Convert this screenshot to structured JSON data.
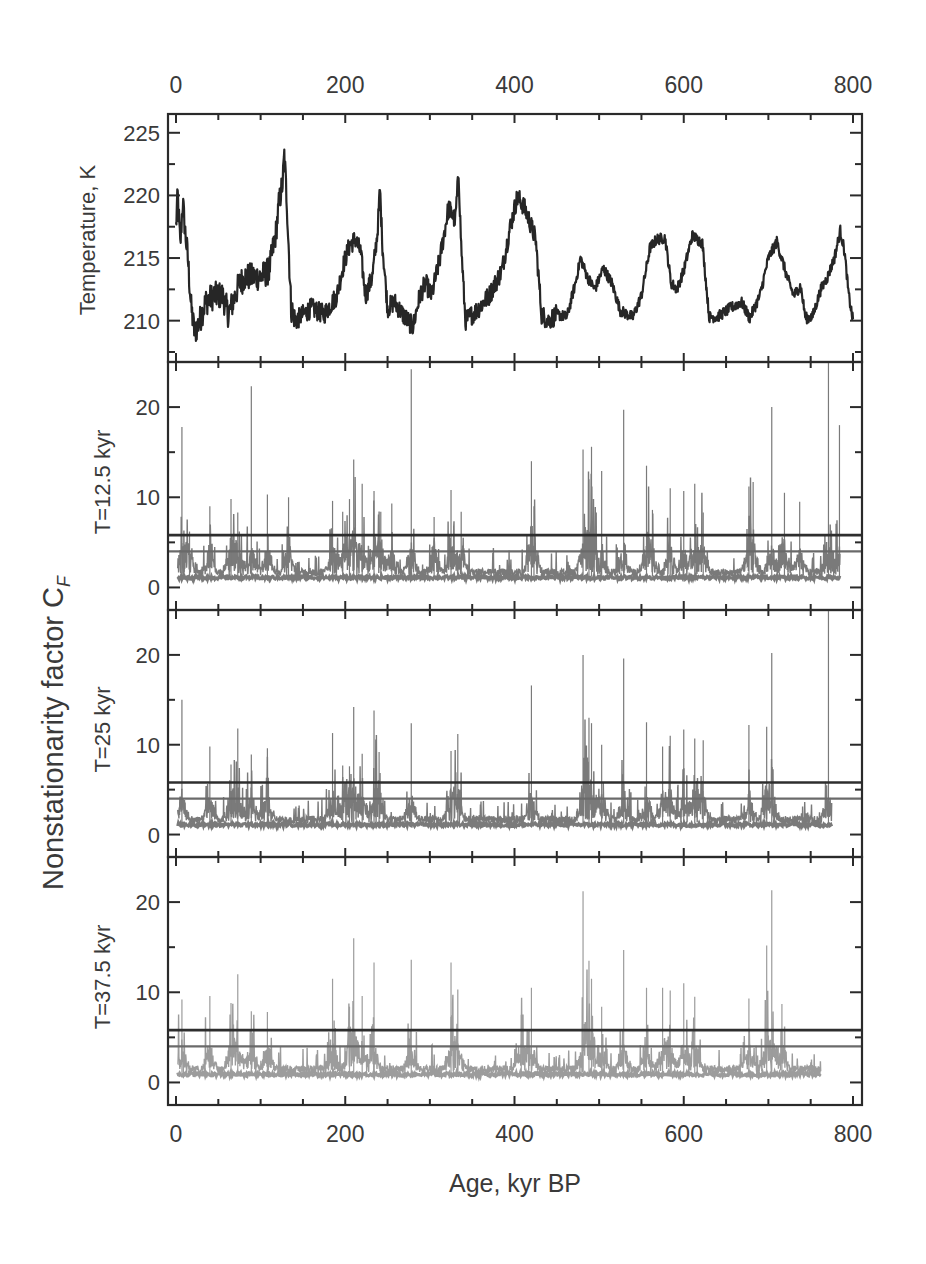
{
  "chart_data": {
    "type": "line",
    "layout": "4 vertically stacked panels sharing x axis",
    "x_axis": {
      "label": "Age, kyr BP",
      "range": [
        0,
        800
      ],
      "major_ticks": [
        0,
        200,
        400,
        600,
        800
      ],
      "minor_tick_step": 50,
      "top_tick_labels": [
        "0",
        "200",
        "400",
        "600",
        "800"
      ],
      "bottom_tick_labels": [
        "0",
        "200",
        "400",
        "600",
        "800"
      ]
    },
    "shared_ylabel": {
      "text": "Nonstationarity factor C",
      "subscript": "F"
    },
    "panels": [
      {
        "id": "temperature",
        "ylabel": "Temperature, K",
        "ylim": [
          206.7,
          226.5
        ],
        "major_ticks": [
          210,
          215,
          220,
          225
        ],
        "tick_labels": [
          "210",
          "215",
          "220",
          "225"
        ],
        "minor_tick_step": 2.5,
        "series_color": "#262626",
        "series": {
          "name": "Temperature",
          "x": [
            0,
            2,
            5,
            8,
            11,
            14,
            18,
            22,
            28,
            35,
            45,
            55,
            62,
            70,
            75,
            82,
            90,
            100,
            110,
            118,
            122,
            126,
            128,
            131,
            136,
            142,
            150,
            160,
            175,
            190,
            198,
            205,
            212,
            218,
            224,
            232,
            238,
            241,
            244,
            250,
            258,
            268,
            280,
            288,
            295,
            302,
            312,
            322,
            330,
            334,
            337,
            342,
            355,
            370,
            385,
            395,
            403,
            408,
            415,
            425,
            432,
            440,
            450,
            462,
            472,
            478,
            486,
            495,
            505,
            515,
            525,
            533,
            540,
            550,
            560,
            568,
            578,
            585,
            592,
            600,
            610,
            622,
            630,
            640,
            655,
            668,
            678,
            690,
            700,
            710,
            722,
            730,
            738,
            744,
            752,
            762,
            770,
            778,
            785,
            790,
            795,
            800
          ],
          "y": [
            217.5,
            220,
            216,
            219.5,
            217,
            215,
            211,
            209,
            210,
            211.5,
            212,
            212,
            210.5,
            212,
            213,
            213.5,
            213.5,
            213.5,
            214,
            217,
            219.5,
            221,
            223.2,
            219.5,
            211,
            210,
            210.5,
            211,
            210.5,
            212,
            214.5,
            216,
            216.5,
            215.5,
            212,
            213.5,
            217,
            220.5,
            216,
            211,
            211.5,
            210.5,
            209.5,
            212,
            213,
            212,
            215,
            219,
            218,
            221.8,
            216,
            210,
            210.8,
            212,
            214,
            217.5,
            219.8,
            219.5,
            218.5,
            216.5,
            210.5,
            210,
            210.5,
            210.3,
            213,
            215,
            213.5,
            212.5,
            214.2,
            213,
            210.8,
            210.5,
            210.3,
            212,
            215.8,
            216.5,
            216.6,
            213,
            212.5,
            214,
            216.8,
            216.2,
            210.3,
            210.3,
            211,
            211.5,
            210.2,
            212,
            215,
            216.3,
            213.5,
            212,
            212.8,
            210.2,
            210.3,
            212.5,
            213.5,
            215,
            217.2,
            215.5,
            212,
            210
          ]
        }
      },
      {
        "id": "cf_12_5",
        "ylabel": "T=12.5 kyr",
        "ylim": [
          -2.5,
          25
        ],
        "major_ticks": [
          0,
          10,
          20
        ],
        "tick_labels": [
          "0",
          "10",
          "20"
        ],
        "minor_tick_step": 5,
        "series_color": "#7a7a7a",
        "series_end_kyr": 785,
        "baseline_level": 1.2,
        "thresholds": [
          {
            "value": 5.8,
            "color": "#2e2e2e"
          },
          {
            "value": 4.0,
            "color": "#6a6a6a"
          }
        ],
        "spikes": [
          {
            "x": 7,
            "y": 17.8
          },
          {
            "x": 16,
            "y": 6.2
          },
          {
            "x": 40,
            "y": 9.0
          },
          {
            "x": 65,
            "y": 9.8
          },
          {
            "x": 73,
            "y": 8.3
          },
          {
            "x": 89,
            "y": 22.3
          },
          {
            "x": 108,
            "y": 10.3
          },
          {
            "x": 133,
            "y": 10.0
          },
          {
            "x": 185,
            "y": 9.6
          },
          {
            "x": 197,
            "y": 8.4
          },
          {
            "x": 205,
            "y": 9.8
          },
          {
            "x": 210,
            "y": 14.2
          },
          {
            "x": 220,
            "y": 11.5
          },
          {
            "x": 234,
            "y": 10.7
          },
          {
            "x": 242,
            "y": 8.4
          },
          {
            "x": 255,
            "y": 9.3
          },
          {
            "x": 278,
            "y": 24.2
          },
          {
            "x": 305,
            "y": 7.8
          },
          {
            "x": 325,
            "y": 10.8
          },
          {
            "x": 337,
            "y": 8.4
          },
          {
            "x": 420,
            "y": 14.0
          },
          {
            "x": 423,
            "y": 9.0
          },
          {
            "x": 481,
            "y": 15.3
          },
          {
            "x": 488,
            "y": 12.0
          },
          {
            "x": 491,
            "y": 15.6
          },
          {
            "x": 503,
            "y": 12.9
          },
          {
            "x": 529,
            "y": 19.7
          },
          {
            "x": 556,
            "y": 13.5
          },
          {
            "x": 563,
            "y": 8.6
          },
          {
            "x": 584,
            "y": 11.0
          },
          {
            "x": 600,
            "y": 10.7
          },
          {
            "x": 613,
            "y": 11.5
          },
          {
            "x": 623,
            "y": 8.3
          },
          {
            "x": 677,
            "y": 11.2
          },
          {
            "x": 682,
            "y": 11.7
          },
          {
            "x": 704,
            "y": 20.0
          },
          {
            "x": 719,
            "y": 10.5
          },
          {
            "x": 737,
            "y": 9.5
          },
          {
            "x": 771,
            "y": 25.0
          },
          {
            "x": 784,
            "y": 18.0
          }
        ]
      },
      {
        "id": "cf_25",
        "ylabel": "T=25 kyr",
        "ylim": [
          -2.5,
          25
        ],
        "major_ticks": [
          0,
          10,
          20
        ],
        "tick_labels": [
          "0",
          "10",
          "20"
        ],
        "minor_tick_step": 5,
        "series_color": "#7a7a7a",
        "series_end_kyr": 775,
        "baseline_level": 1.2,
        "thresholds": [
          {
            "value": 5.8,
            "color": "#2e2e2e"
          },
          {
            "value": 4.0,
            "color": "#6a6a6a"
          }
        ],
        "spikes": [
          {
            "x": 7,
            "y": 15.0
          },
          {
            "x": 40,
            "y": 9.8
          },
          {
            "x": 65,
            "y": 7.8
          },
          {
            "x": 73,
            "y": 11.8
          },
          {
            "x": 89,
            "y": 8.9
          },
          {
            "x": 108,
            "y": 9.6
          },
          {
            "x": 185,
            "y": 11.3
          },
          {
            "x": 197,
            "y": 7.7
          },
          {
            "x": 205,
            "y": 7.6
          },
          {
            "x": 210,
            "y": 14.2
          },
          {
            "x": 220,
            "y": 9.0
          },
          {
            "x": 234,
            "y": 13.8
          },
          {
            "x": 240,
            "y": 9.2
          },
          {
            "x": 278,
            "y": 12.4
          },
          {
            "x": 325,
            "y": 9.3
          },
          {
            "x": 333,
            "y": 11.2
          },
          {
            "x": 420,
            "y": 16.6
          },
          {
            "x": 481,
            "y": 20.0
          },
          {
            "x": 488,
            "y": 13.0
          },
          {
            "x": 491,
            "y": 12.4
          },
          {
            "x": 503,
            "y": 10.0
          },
          {
            "x": 529,
            "y": 19.6
          },
          {
            "x": 556,
            "y": 12.5
          },
          {
            "x": 575,
            "y": 9.8
          },
          {
            "x": 584,
            "y": 11.0
          },
          {
            "x": 600,
            "y": 11.7
          },
          {
            "x": 613,
            "y": 10.7
          },
          {
            "x": 623,
            "y": 10.5
          },
          {
            "x": 677,
            "y": 12.2
          },
          {
            "x": 698,
            "y": 12.0
          },
          {
            "x": 704,
            "y": 20.2
          },
          {
            "x": 771,
            "y": 25.0
          }
        ]
      },
      {
        "id": "cf_37_5",
        "ylabel": "T=37.5 kyr",
        "ylim": [
          -2.5,
          25
        ],
        "major_ticks": [
          0,
          10,
          20
        ],
        "tick_labels": [
          "0",
          "10",
          "20"
        ],
        "minor_tick_step": 5,
        "series_color": "#9c9c9c",
        "series_end_kyr": 762,
        "baseline_level": 1.0,
        "thresholds": [
          {
            "value": 5.8,
            "color": "#2e2e2e"
          },
          {
            "value": 4.0,
            "color": "#6a6a6a"
          }
        ],
        "spikes": [
          {
            "x": 7,
            "y": 9.2
          },
          {
            "x": 40,
            "y": 9.6
          },
          {
            "x": 65,
            "y": 8.8
          },
          {
            "x": 73,
            "y": 12.0
          },
          {
            "x": 89,
            "y": 7.9
          },
          {
            "x": 108,
            "y": 7.8
          },
          {
            "x": 185,
            "y": 11.5
          },
          {
            "x": 205,
            "y": 8.4
          },
          {
            "x": 210,
            "y": 16.0
          },
          {
            "x": 220,
            "y": 9.6
          },
          {
            "x": 234,
            "y": 13.3
          },
          {
            "x": 278,
            "y": 13.6
          },
          {
            "x": 325,
            "y": 13.3
          },
          {
            "x": 333,
            "y": 10.3
          },
          {
            "x": 408,
            "y": 7.5
          },
          {
            "x": 420,
            "y": 10.5
          },
          {
            "x": 481,
            "y": 21.2
          },
          {
            "x": 488,
            "y": 13.5
          },
          {
            "x": 491,
            "y": 11.5
          },
          {
            "x": 503,
            "y": 8.4
          },
          {
            "x": 529,
            "y": 14.7
          },
          {
            "x": 556,
            "y": 10.5
          },
          {
            "x": 575,
            "y": 10.5
          },
          {
            "x": 584,
            "y": 10.2
          },
          {
            "x": 600,
            "y": 11.0
          },
          {
            "x": 613,
            "y": 9.5
          },
          {
            "x": 677,
            "y": 9.3
          },
          {
            "x": 698,
            "y": 15.2
          },
          {
            "x": 704,
            "y": 21.3
          },
          {
            "x": 716,
            "y": 8.7
          }
        ]
      }
    ]
  }
}
